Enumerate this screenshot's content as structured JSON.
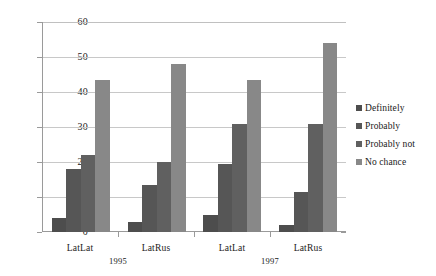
{
  "chart_data": {
    "type": "bar",
    "title": "",
    "subtitle": "",
    "xlabel": "",
    "ylabel": "",
    "ylim": [
      0,
      60
    ],
    "ytick_values": [
      0,
      10,
      20,
      30,
      40,
      50,
      60
    ],
    "ytick_labels": [
      "0",
      "10",
      "20",
      "30",
      "40",
      "50",
      "60"
    ],
    "grid": true,
    "legend_position": "right",
    "categories": [
      "LatLat",
      "LatRus",
      "LatLat",
      "LatRus"
    ],
    "group_labels": [
      "1995",
      "1997"
    ],
    "series": [
      {
        "name": "Definitely",
        "color": "#4d4d4d",
        "values": [
          4,
          3,
          5,
          2
        ]
      },
      {
        "name": "Probably",
        "color": "#565656",
        "values": [
          18,
          13.5,
          19.5,
          11.5
        ]
      },
      {
        "name": "Probably not",
        "color": "#606060",
        "values": [
          22,
          20,
          31,
          31
        ]
      },
      {
        "name": "No chance",
        "color": "#888888",
        "values": [
          43.5,
          48,
          43.5,
          54
        ]
      }
    ]
  },
  "legend": {
    "items": [
      {
        "label": "Definitely"
      },
      {
        "label": "Probably"
      },
      {
        "label": "Probably not"
      },
      {
        "label": "No chance"
      }
    ]
  },
  "axis": {
    "y": {
      "labels": [
        "60",
        "50",
        "40",
        "30",
        "20",
        "10",
        "0"
      ]
    },
    "x": {
      "category_labels": [
        "LatLat",
        "LatRus",
        "LatLat",
        "LatRus"
      ],
      "group_labels": [
        "1995",
        "1997"
      ]
    }
  },
  "colors": {
    "series_1": "#4d4d4d",
    "series_2": "#565656",
    "series_3": "#606060",
    "series_4": "#888888",
    "grid": "#c8c8c8",
    "axis": "#9a9a9a",
    "background": "#ffffff",
    "text": "#1a1a1a"
  }
}
